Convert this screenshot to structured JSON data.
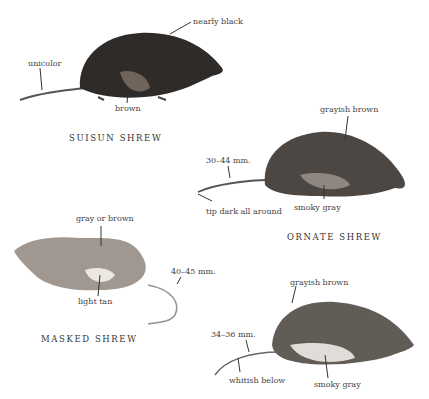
{
  "shrews": [
    {
      "name": "SUISUN SHREW",
      "labels": {
        "back": "nearly black",
        "tail": "unicolor",
        "belly": "brown"
      },
      "colors": {
        "body": "#2c2a28",
        "belly": "#7a6e66"
      }
    },
    {
      "name": "ORNATE SHREW",
      "labels": {
        "back": "grayish brown",
        "tail_length": "30–44 mm.",
        "tail_tip": "tip dark all around",
        "belly": "smoky gray"
      },
      "colors": {
        "body": "#4a4541",
        "belly": "#8f8883"
      }
    },
    {
      "name": "MASKED SHREW",
      "labels": {
        "back": "gray or brown",
        "belly": "light tan",
        "tail_length": "40–45 mm."
      },
      "colors": {
        "body": "#8a837c",
        "belly": "#e6e1da"
      }
    },
    {
      "name": "",
      "labels": {
        "back": "grayish brown",
        "tail_length": "34–36 mm.",
        "tail_under": "whitish below",
        "belly": "smoky gray"
      },
      "colors": {
        "body": "#5e5853",
        "belly": "#dedad6"
      }
    }
  ]
}
